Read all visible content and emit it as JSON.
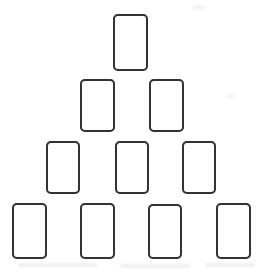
{
  "board": {
    "label": "pyramid-card-layout",
    "row_counts": [
      1,
      2,
      3,
      4
    ],
    "card_count": 10,
    "cards": [
      {
        "id": 1,
        "row": 1,
        "col": 1,
        "x": 113,
        "y": 14,
        "w": 35,
        "h": 57
      },
      {
        "id": 2,
        "row": 2,
        "col": 1,
        "x": 80,
        "y": 79,
        "w": 35,
        "h": 53
      },
      {
        "id": 3,
        "row": 2,
        "col": 2,
        "x": 149,
        "y": 79,
        "w": 35,
        "h": 53
      },
      {
        "id": 4,
        "row": 3,
        "col": 1,
        "x": 46,
        "y": 141,
        "w": 34,
        "h": 53
      },
      {
        "id": 5,
        "row": 3,
        "col": 2,
        "x": 115,
        "y": 141,
        "w": 34,
        "h": 53
      },
      {
        "id": 6,
        "row": 3,
        "col": 3,
        "x": 182,
        "y": 141,
        "w": 34,
        "h": 53
      },
      {
        "id": 7,
        "row": 4,
        "col": 1,
        "x": 12,
        "y": 203,
        "w": 35,
        "h": 56
      },
      {
        "id": 8,
        "row": 4,
        "col": 2,
        "x": 80,
        "y": 203,
        "w": 35,
        "h": 56
      },
      {
        "id": 9,
        "row": 4,
        "col": 3,
        "x": 148,
        "y": 204,
        "w": 34,
        "h": 55
      },
      {
        "id": 10,
        "row": 4,
        "col": 4,
        "x": 216,
        "y": 203,
        "w": 35,
        "h": 56
      }
    ],
    "card_face": "blank"
  },
  "card_style": {
    "border_width_px": 2,
    "corner_radius_px": 5
  },
  "colors": {
    "background": "#ffffff",
    "card_fill": "#ffffff",
    "card_border": "#333333"
  },
  "artifacts": [
    {
      "kind": "smudge",
      "x": 192,
      "y": 5,
      "w": 14,
      "h": 5
    },
    {
      "kind": "smudge",
      "x": 226,
      "y": 94,
      "w": 10,
      "h": 4
    },
    {
      "kind": "streak",
      "x": 18,
      "y": 263,
      "w": 80,
      "h": 4
    },
    {
      "kind": "streak",
      "x": 120,
      "y": 264,
      "w": 70,
      "h": 4
    },
    {
      "kind": "streak",
      "x": 205,
      "y": 263,
      "w": 50,
      "h": 4
    }
  ]
}
